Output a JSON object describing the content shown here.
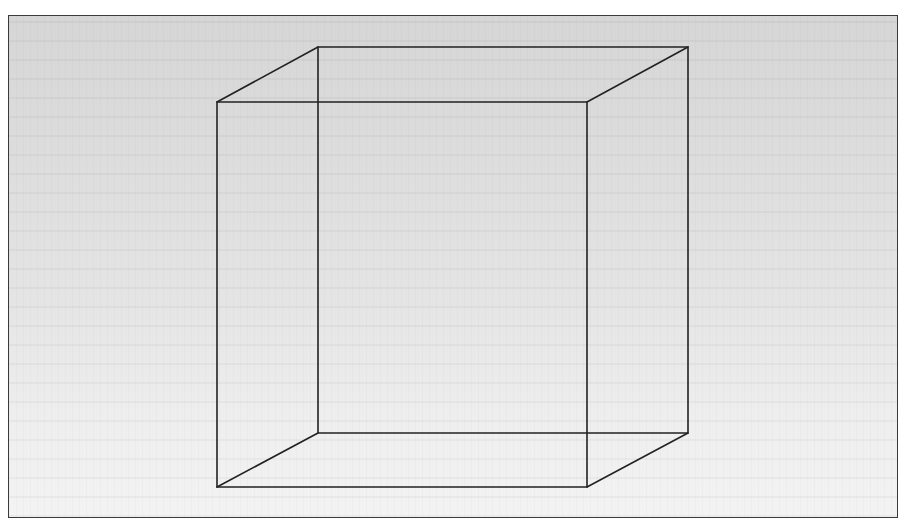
{
  "figure": {
    "frame": {
      "x": 8,
      "y": 15,
      "width": 890,
      "height": 503
    },
    "colors": {
      "line": "#222222",
      "frame_border": "#3a3a3a",
      "background_top": "#d6d6d6",
      "background_bottom": "#f3f3f3"
    },
    "front_face": {
      "top_left": [
        217,
        102
      ],
      "top_right": [
        587,
        102
      ],
      "bottom_right": [
        587,
        487
      ],
      "bottom_left": [
        217,
        487
      ]
    },
    "back_face": {
      "top_left": [
        318,
        47
      ],
      "top_right": [
        688,
        47
      ],
      "bottom_right": [
        688,
        433
      ],
      "bottom_left": [
        318,
        433
      ]
    }
  }
}
